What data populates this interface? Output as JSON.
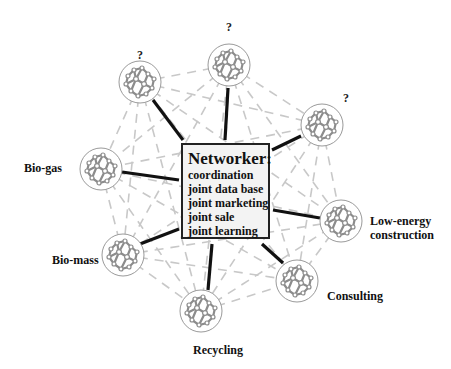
{
  "hub": {
    "title": "Networker:",
    "items": [
      "coordination",
      "joint data base",
      "joint marketing",
      "joint sale",
      "joint learning"
    ]
  },
  "nodes": [
    {
      "id": "unknown-top-left",
      "label": "?",
      "cx": 140,
      "cy": 82
    },
    {
      "id": "unknown-top",
      "label": "?",
      "cx": 229,
      "cy": 65
    },
    {
      "id": "unknown-top-right",
      "label": "?",
      "cx": 322,
      "cy": 125
    },
    {
      "id": "bio-gas",
      "label": "Bio-gas",
      "cx": 101,
      "cy": 169
    },
    {
      "id": "bio-mass",
      "label": "Bio-mass",
      "cx": 123,
      "cy": 255
    },
    {
      "id": "recycling",
      "label": "Recycling",
      "cx": 201,
      "cy": 311
    },
    {
      "id": "consulting",
      "label": "Consulting",
      "cx": 297,
      "cy": 281
    },
    {
      "id": "low-energy",
      "label": "Low-energy construction",
      "line1": "Low-energy",
      "line2": "construction",
      "cx": 341,
      "cy": 221
    }
  ],
  "colors": {
    "hub_fill": "#f3f3f3",
    "hub_border": "#222222",
    "spoke": "#111111",
    "dashed": "#c8c8c8",
    "node_stroke": "#9a9a9a",
    "node_inner": "#8c8c8c"
  }
}
